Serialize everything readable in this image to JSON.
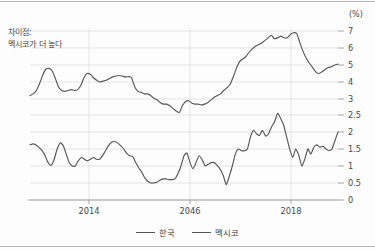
{
  "chart_data": {
    "type": "line",
    "title": "",
    "subtitle": "",
    "xlabel": "",
    "ylabel": "",
    "unit_label": "(%)",
    "grid": true,
    "legend_position": "bottom",
    "annotation": {
      "line1": "차이점:",
      "line2": "멕시코가 더 높다"
    },
    "x_tick_labels": [
      "2014",
      "2046",
      "2018"
    ],
    "y_tick_labels": [
      "7",
      "6",
      "5",
      "4",
      "3",
      "2.5",
      "2",
      "1.5",
      "1",
      "0.5",
      "0"
    ],
    "upper_panel": {
      "series_name": "멕시코",
      "ylim": [
        3,
        7
      ],
      "ticks": [
        3,
        4,
        5,
        6,
        7
      ],
      "values": [
        3.2,
        3.3,
        3.5,
        3.9,
        4.4,
        4.75,
        4.8,
        4.65,
        4.2,
        3.7,
        3.5,
        3.45,
        3.5,
        3.55,
        3.5,
        3.55,
        3.8,
        4.25,
        4.5,
        4.45,
        4.25,
        4.1,
        4.0,
        4.05,
        4.1,
        4.2,
        4.3,
        4.35,
        4.38,
        4.35,
        4.3,
        4.32,
        4.25,
        3.7,
        3.45,
        3.4,
        3.3,
        3.3,
        3.2,
        3.05,
        2.95,
        2.8,
        2.7,
        2.7,
        2.6,
        2.45,
        2.3,
        2.2,
        2.6,
        2.85,
        2.9,
        2.75,
        2.7,
        2.7,
        2.65,
        2.7,
        2.8,
        2.95,
        3.1,
        3.2,
        3.3,
        3.5,
        3.65,
        3.85,
        4.3,
        4.8,
        5.2,
        5.35,
        5.5,
        5.75,
        5.95,
        6.1,
        6.2,
        6.3,
        6.45,
        6.6,
        6.75,
        6.55,
        6.6,
        6.7,
        6.6,
        6.6,
        6.8,
        6.9,
        6.85,
        6.3,
        5.8,
        5.4,
        5.1,
        4.85,
        4.6,
        4.5,
        4.6,
        4.75,
        4.85,
        4.9,
        5.0,
        5.05
      ]
    },
    "lower_panel": {
      "series_name": "한국",
      "ylim": [
        0,
        2.5
      ],
      "ticks": [
        0,
        0.5,
        1,
        1.5,
        2,
        2.5
      ],
      "values": [
        1.62,
        1.65,
        1.62,
        1.55,
        1.45,
        1.3,
        1.1,
        1.02,
        1.2,
        1.5,
        1.68,
        1.6,
        1.35,
        1.1,
        1.0,
        1.0,
        1.15,
        1.25,
        1.2,
        1.15,
        1.2,
        1.25,
        1.2,
        1.2,
        1.3,
        1.45,
        1.6,
        1.7,
        1.72,
        1.68,
        1.6,
        1.5,
        1.38,
        1.3,
        1.28,
        1.1,
        0.95,
        0.82,
        0.65,
        0.55,
        0.5,
        0.5,
        0.52,
        0.58,
        0.62,
        0.62,
        0.6,
        0.6,
        0.62,
        0.78,
        1.0,
        1.3,
        1.38,
        1.1,
        0.92,
        1.1,
        1.3,
        1.18,
        1.0,
        1.05,
        1.1,
        1.1,
        1.02,
        0.9,
        0.72,
        0.45,
        0.7,
        1.0,
        1.35,
        1.5,
        1.45,
        1.45,
        1.5,
        1.85,
        2.05,
        1.95,
        1.9,
        2.05,
        1.88,
        1.95,
        2.15,
        2.3,
        2.55,
        2.4,
        2.2,
        1.85,
        1.5,
        1.25,
        1.5,
        1.32,
        1.0,
        1.2,
        1.5,
        1.35,
        1.55,
        1.62,
        1.55,
        1.58,
        1.5,
        1.45,
        1.5,
        1.75,
        2.0
      ]
    }
  },
  "legend": {
    "items": [
      {
        "label": "한국",
        "color": "#575757"
      },
      {
        "label": "멕시코",
        "color": "#575757"
      }
    ]
  },
  "colors": {
    "line": "#575757",
    "grid": "#d8d8d8",
    "axis": "#8f8f8f",
    "text": "#4a4a4a"
  }
}
